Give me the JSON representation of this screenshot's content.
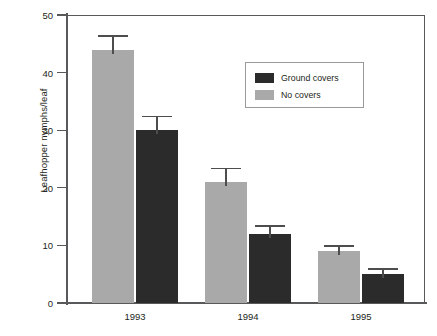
{
  "chart_data": {
    "type": "bar",
    "title": "",
    "xlabel": "",
    "ylabel": "Leafhopper nymphs/leaf",
    "categories": [
      "1993",
      "1994",
      "1995"
    ],
    "ylim": [
      0,
      50
    ],
    "yticks": [
      0,
      10,
      20,
      30,
      40,
      50
    ],
    "ytick_labels": [
      "0",
      "10",
      "20",
      "30",
      "40",
      "50"
    ],
    "grid": false,
    "legend_position": "upper-right-inside",
    "series": [
      {
        "name": "No covers",
        "color": "#a9a9a9",
        "values": [
          44,
          21,
          9
        ],
        "errors": [
          2.5,
          2.5,
          1
        ]
      },
      {
        "name": "Ground covers",
        "color": "#2b2b2b",
        "values": [
          30,
          12,
          5
        ],
        "errors": [
          2.5,
          1.5,
          1
        ]
      }
    ],
    "legend_entries": [
      {
        "label": "Ground covers",
        "color": "#2b2b2b"
      },
      {
        "label": "No covers",
        "color": "#a9a9a9"
      }
    ]
  },
  "axis": {
    "y_title": "Leafhopper nymphs/leaf",
    "tick_0": "0",
    "tick_10": "10",
    "tick_20": "20",
    "tick_30": "30",
    "tick_40": "40",
    "tick_50": "50"
  },
  "categories": {
    "c0": "1993",
    "c1": "1994",
    "c2": "1995"
  },
  "legend": {
    "item0": "Ground covers",
    "item1": "No covers"
  },
  "colors": {
    "light_bar": "#a9a9a9",
    "dark_bar": "#2b2b2b",
    "axis": "#58595b",
    "text": "#231f20",
    "background": "#ffffff"
  }
}
